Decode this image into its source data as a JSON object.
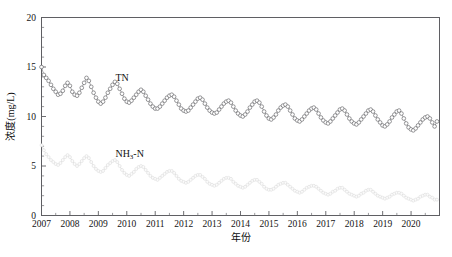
{
  "chart_data": {
    "type": "line",
    "title": "",
    "xlabel": "年份",
    "ylabel": "浓度(mg/L)",
    "xlim": [
      2007.0,
      2021.0
    ],
    "ylim": [
      0,
      20
    ],
    "ytick_labels": [
      "0",
      "5",
      "10",
      "15",
      "20"
    ],
    "ytick_values": [
      0,
      5,
      10,
      15,
      20
    ],
    "y_minor_interval": 1,
    "xtick_labels": [
      "2007",
      "2008",
      "2009",
      "2010",
      "2011",
      "2012",
      "2013",
      "2014",
      "2015",
      "2016",
      "2017",
      "2018",
      "2019",
      "2020"
    ],
    "xtick_values": [
      2007,
      2008,
      2009,
      2010,
      2011,
      2012,
      2013,
      2014,
      2015,
      2016,
      2017,
      2018,
      2019,
      2020
    ],
    "grid": false,
    "legend_position": "inline-annotation",
    "annotations": [
      {
        "text": "TN",
        "x": 2009.6,
        "y": 13.6
      },
      {
        "text": "NH3-N",
        "x": 2009.6,
        "y": 5.9
      }
    ],
    "series": [
      {
        "name": "TN",
        "label": "TN",
        "color": "#59595d",
        "marker": "open-circle",
        "x_start": 2007.0,
        "x_step": 0.0833,
        "values": [
          15.0,
          14.2,
          13.9,
          13.6,
          13.2,
          12.8,
          12.5,
          12.2,
          12.3,
          12.6,
          13.1,
          13.4,
          13.1,
          12.5,
          12.2,
          12.1,
          12.4,
          12.9,
          13.4,
          13.9,
          13.6,
          13.0,
          12.4,
          11.9,
          11.5,
          11.3,
          11.5,
          11.9,
          12.4,
          12.8,
          13.2,
          13.5,
          13.3,
          12.8,
          12.3,
          11.8,
          11.5,
          11.4,
          11.6,
          11.9,
          12.2,
          12.5,
          12.7,
          12.5,
          12.1,
          11.7,
          11.3,
          11.0,
          10.8,
          10.8,
          11.0,
          11.3,
          11.6,
          11.9,
          12.1,
          12.2,
          12.0,
          11.6,
          11.2,
          10.8,
          10.6,
          10.5,
          10.6,
          10.9,
          11.2,
          11.5,
          11.8,
          11.9,
          11.7,
          11.3,
          10.9,
          10.6,
          10.4,
          10.3,
          10.4,
          10.7,
          11.0,
          11.3,
          11.5,
          11.6,
          11.4,
          11.0,
          10.6,
          10.3,
          10.1,
          10.0,
          10.2,
          10.5,
          10.9,
          11.2,
          11.5,
          11.6,
          11.4,
          11.0,
          10.5,
          10.1,
          9.8,
          9.7,
          9.9,
          10.2,
          10.6,
          10.9,
          11.1,
          11.2,
          11.0,
          10.6,
          10.2,
          9.8,
          9.6,
          9.5,
          9.7,
          10.0,
          10.3,
          10.6,
          10.8,
          10.9,
          10.7,
          10.3,
          9.9,
          9.6,
          9.4,
          9.3,
          9.5,
          9.8,
          10.1,
          10.4,
          10.7,
          10.8,
          10.6,
          10.2,
          9.8,
          9.5,
          9.3,
          9.2,
          9.4,
          9.7,
          10.0,
          10.3,
          10.6,
          10.7,
          10.5,
          10.1,
          9.7,
          9.4,
          9.1,
          9.0,
          9.2,
          9.5,
          9.9,
          10.2,
          10.5,
          10.6,
          10.3,
          9.8,
          9.3,
          8.9,
          8.7,
          8.6,
          8.8,
          9.1,
          9.4,
          9.7,
          9.9,
          10.0,
          9.8,
          9.4,
          9.0,
          9.5
        ]
      },
      {
        "name": "NH3-N",
        "label": "NH3-N",
        "color": "#dadada",
        "marker": "open-circle",
        "x_start": 2007.0,
        "x_step": 0.0833,
        "values": [
          7.1,
          6.6,
          6.2,
          5.9,
          5.6,
          5.4,
          5.2,
          5.1,
          5.3,
          5.6,
          5.9,
          6.1,
          5.9,
          5.5,
          5.2,
          5.0,
          5.2,
          5.5,
          5.8,
          6.0,
          5.8,
          5.4,
          5.0,
          4.7,
          4.5,
          4.4,
          4.5,
          4.8,
          5.1,
          5.3,
          5.5,
          5.6,
          5.4,
          5.0,
          4.6,
          4.3,
          4.1,
          4.0,
          4.2,
          4.4,
          4.7,
          4.9,
          5.0,
          4.9,
          4.6,
          4.3,
          4.0,
          3.8,
          3.7,
          3.6,
          3.8,
          4.0,
          4.2,
          4.4,
          4.5,
          4.5,
          4.3,
          4.0,
          3.7,
          3.5,
          3.4,
          3.3,
          3.4,
          3.6,
          3.8,
          4.0,
          4.1,
          4.1,
          3.9,
          3.7,
          3.4,
          3.2,
          3.1,
          3.0,
          3.1,
          3.3,
          3.5,
          3.7,
          3.8,
          3.8,
          3.7,
          3.4,
          3.2,
          3.0,
          2.9,
          2.8,
          2.9,
          3.1,
          3.3,
          3.5,
          3.6,
          3.6,
          3.4,
          3.2,
          2.9,
          2.7,
          2.6,
          2.6,
          2.7,
          2.9,
          3.1,
          3.2,
          3.3,
          3.3,
          3.1,
          2.9,
          2.7,
          2.5,
          2.4,
          2.3,
          2.4,
          2.6,
          2.8,
          2.9,
          3.0,
          3.0,
          2.9,
          2.7,
          2.5,
          2.3,
          2.2,
          2.1,
          2.2,
          2.4,
          2.5,
          2.7,
          2.8,
          2.8,
          2.6,
          2.4,
          2.2,
          2.1,
          2.0,
          1.9,
          2.0,
          2.2,
          2.3,
          2.5,
          2.6,
          2.6,
          2.4,
          2.2,
          2.0,
          1.9,
          1.8,
          1.7,
          1.8,
          1.9,
          2.1,
          2.2,
          2.3,
          2.3,
          2.2,
          2.0,
          1.8,
          1.7,
          1.6,
          1.5,
          1.6,
          1.7,
          1.9,
          2.0,
          2.1,
          2.1,
          1.9,
          1.8,
          1.6,
          1.6
        ]
      }
    ]
  },
  "axis": {
    "ylabel_main": "浓度",
    "ylabel_unit": "(mg/L)",
    "xlabel": "年份"
  }
}
